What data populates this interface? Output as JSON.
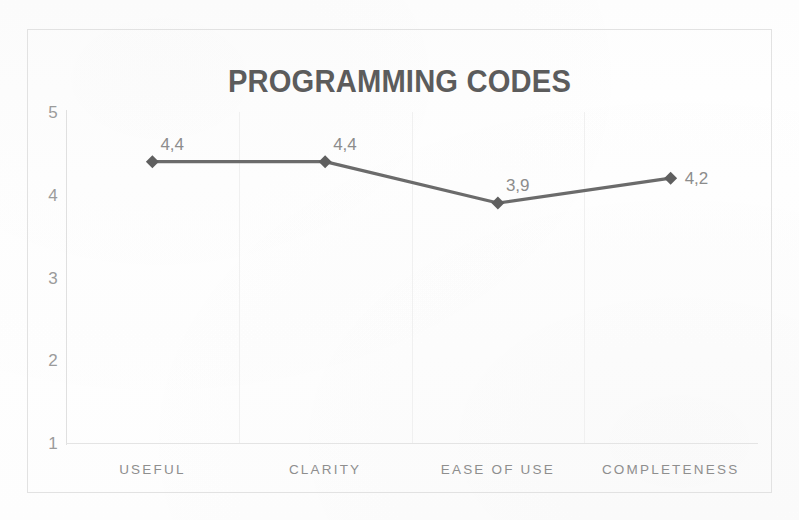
{
  "chart_data": {
    "type": "line",
    "title": "PROGRAMMING CODES",
    "xlabel": "",
    "ylabel": "",
    "categories": [
      "USEFUL",
      "CLARITY",
      "EASE OF USE",
      "COMPLETENESS"
    ],
    "values": [
      4.4,
      4.4,
      3.9,
      4.2
    ],
    "point_labels": [
      "4,4",
      "4,4",
      "3,9",
      "4,2"
    ],
    "ylim": [
      1,
      5
    ],
    "yticks": [
      5,
      4,
      3,
      2,
      1
    ],
    "ytick_labels": [
      "5",
      "4",
      "3",
      "2",
      "1"
    ],
    "grid": {
      "vertical": true,
      "horizontal": false
    },
    "legend": {
      "visible": false,
      "position": "none"
    },
    "marker": "diamond",
    "decimal_separator": ",",
    "colors": {
      "line": "#6b6b6b",
      "marker": "#5f5f5f",
      "title_text": "#5c5c5c",
      "tick_text": "#9b9b9b",
      "category_text": "#8e8e8e",
      "data_label_text": "#8c8c8c",
      "gridline": "#f0f0f0",
      "axis": "#e0e0e0",
      "frame": "#e2e2e2",
      "background": "#ffffff"
    }
  },
  "chart": {
    "title": "PROGRAMMING CODES",
    "y_axis": {
      "ticks": [
        {
          "label": "5",
          "value": 5
        },
        {
          "label": "4",
          "value": 4
        },
        {
          "label": "3",
          "value": 3
        },
        {
          "label": "2",
          "value": 2
        },
        {
          "label": "1",
          "value": 1
        }
      ]
    },
    "x_axis": {
      "categories": [
        {
          "label": "USEFUL"
        },
        {
          "label": "CLARITY"
        },
        {
          "label": "EASE OF USE"
        },
        {
          "label": "COMPLETENESS"
        }
      ]
    },
    "series": [
      {
        "name": "Programming Codes ratings",
        "points": [
          {
            "category": "USEFUL",
            "value": 4.4,
            "label": "4,4"
          },
          {
            "category": "CLARITY",
            "value": 4.4,
            "label": "4,4"
          },
          {
            "category": "EASE OF USE",
            "value": 3.9,
            "label": "3,9"
          },
          {
            "category": "COMPLETENESS",
            "value": 4.2,
            "label": "4,2"
          }
        ]
      }
    ]
  }
}
